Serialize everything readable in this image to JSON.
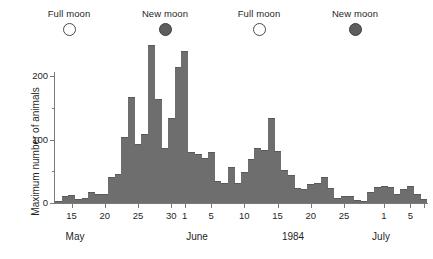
{
  "moon_phases": [
    {
      "label": "Full moon",
      "type": "full",
      "x_px": 69
    },
    {
      "label": "New moon",
      "type": "new",
      "x_px": 165
    },
    {
      "label": "Full moon",
      "type": "full",
      "x_px": 259
    },
    {
      "label": "New moon",
      "type": "new",
      "x_px": 355
    }
  ],
  "chart_data": {
    "type": "bar",
    "title": "",
    "subtitle": "",
    "xlabel": "",
    "ylabel": "Maximum number of animals",
    "ylim": [
      0,
      250
    ],
    "y_major_ticks": [
      0,
      100,
      200
    ],
    "y_minor_ticks": [
      50,
      150
    ],
    "y_tick_labels": [
      "0",
      "100",
      "200"
    ],
    "grid": false,
    "legend_position": "top",
    "bar_color": "#6e6e6e",
    "month_labels": [
      "May",
      "June",
      "1984",
      "July"
    ],
    "x_tick_labels": [
      "15",
      "20",
      "25",
      "30",
      "1",
      "5",
      "10",
      "15",
      "20",
      "25",
      "1",
      "5"
    ],
    "categories": [
      "May 13",
      "May 14",
      "May 15",
      "May 16",
      "May 17",
      "May 18",
      "May 19",
      "May 20",
      "May 21",
      "May 22",
      "May 23",
      "May 24",
      "May 25",
      "May 26",
      "May 27",
      "May 28",
      "May 29",
      "May 30",
      "May 31",
      "Jun 1",
      "Jun 2",
      "Jun 3",
      "Jun 4",
      "Jun 5",
      "Jun 6",
      "Jun 7",
      "Jun 8",
      "Jun 9",
      "Jun 10",
      "Jun 11",
      "Jun 12",
      "Jun 13",
      "Jun 14",
      "Jun 15",
      "Jun 16",
      "Jun 17",
      "Jun 18",
      "Jun 19",
      "Jun 20",
      "Jun 21",
      "Jun 22",
      "Jun 23",
      "Jun 24",
      "Jun 25",
      "Jun 26",
      "Jun 27",
      "Jun 28",
      "Jun 29",
      "Jun 30",
      "Jul 1",
      "Jul 2",
      "Jul 3",
      "Jul 4",
      "Jul 5",
      "Jul 6",
      "Jul 7"
    ],
    "values": [
      2,
      9,
      11,
      5,
      7,
      15,
      13,
      12,
      40,
      44,
      103,
      165,
      92,
      107,
      248,
      162,
      85,
      133,
      213,
      238,
      78,
      75,
      70,
      78,
      33,
      30,
      55,
      30,
      47,
      68,
      85,
      82,
      133,
      80,
      50,
      42,
      22,
      20,
      28,
      30,
      40,
      22,
      7,
      9,
      10,
      3,
      1,
      16,
      24,
      26,
      23,
      12,
      21,
      25,
      12,
      5
    ],
    "n_bars": 56,
    "x_start_label": "May 13",
    "x_end_label": "Jul 7",
    "annotations": [
      "Full moon",
      "New moon",
      "Full moon",
      "New moon"
    ]
  }
}
